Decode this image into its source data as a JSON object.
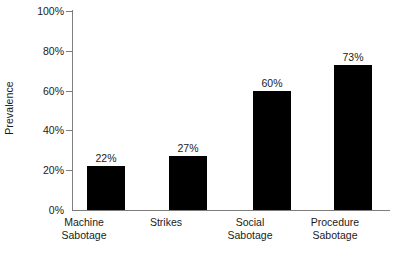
{
  "chart_data": {
    "type": "bar",
    "title": "",
    "xlabel": "",
    "ylabel": "Prevalence",
    "ylim": [
      0,
      100
    ],
    "grid": false,
    "legend": "none",
    "categories": [
      "Machine Sabotage",
      "Strikes",
      "Social Sabotage",
      "Procedure Sabotage"
    ],
    "category_lines": [
      [
        "Machine",
        "Sabotage"
      ],
      [
        "Strikes",
        ""
      ],
      [
        "Social",
        "Sabotage"
      ],
      [
        "Procedure",
        "Sabotage"
      ]
    ],
    "values": [
      22,
      27,
      60,
      73
    ],
    "value_labels": [
      "22%",
      "27%",
      "60%",
      "73%"
    ],
    "y_ticks": [
      0,
      20,
      40,
      60,
      80,
      100
    ],
    "y_tick_labels": [
      "0%",
      "20%",
      "40%",
      "60%",
      "80%",
      "100%"
    ],
    "bar_color": "#000000",
    "axis_color": "#7d7d7d",
    "background": "#ffffff"
  }
}
